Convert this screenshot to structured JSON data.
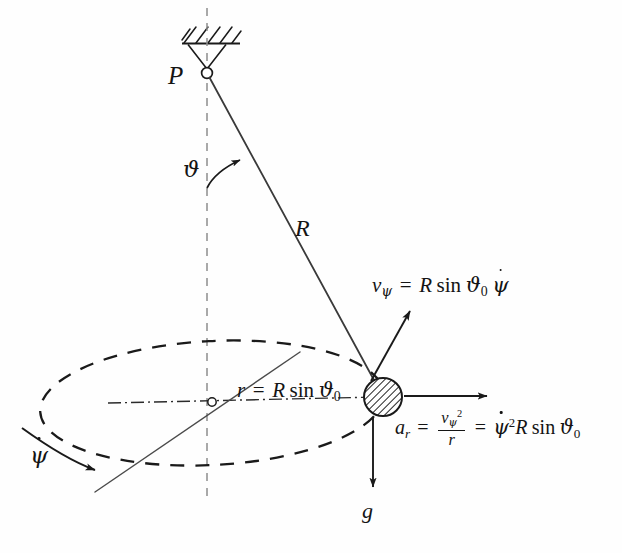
{
  "figure": {
    "background_color": "#fefefe",
    "stroke_color": "#1a1a1a",
    "labels": {
      "pivot": "P",
      "polar_angle": "ϑ",
      "rod_length": "R",
      "azimuth_rate": "ψ",
      "gravity": "g",
      "velocity": {
        "lhs_symbol": "v",
        "lhs_sub": "ψ",
        "equals": "=",
        "rhs_R": "R",
        "rhs_sin": "sin",
        "rhs_theta": "ϑ",
        "rhs_theta_sub": "0",
        "rhs_psidot": "ψ",
        "full_text": "v_ψ = R sin ϑ₀ ψ̇"
      },
      "radius": {
        "lhs_symbol": "r",
        "equals": "=",
        "rhs_R": "R",
        "rhs_sin": "sin",
        "rhs_theta": "ϑ",
        "rhs_theta_sub": "0",
        "full_text": "r = R sin ϑ₀"
      },
      "acceleration": {
        "lhs_symbol": "a",
        "lhs_sub": "r",
        "equals1": "=",
        "frac_num_symbol": "v",
        "frac_num_sub": "ψ",
        "frac_num_sup": "2",
        "frac_den": "r",
        "equals2": "=",
        "rhs_psidot": "ψ",
        "rhs_psidot_sup": "2",
        "rhs_R": "R",
        "rhs_sin": "sin",
        "rhs_theta": "ϑ",
        "rhs_theta_sub": "0",
        "full_text": "a_r = v_ψ²/r = ψ̇² R sin ϑ₀"
      }
    },
    "geometry": {
      "pivot_point": [
        207,
        73
      ],
      "bob_point": [
        383,
        397
      ],
      "ellipse_center": [
        212,
        403
      ],
      "ellipse_rx": 172,
      "ellipse_ry": 62,
      "ceiling_y": 43,
      "bob_radius": 19
    }
  }
}
